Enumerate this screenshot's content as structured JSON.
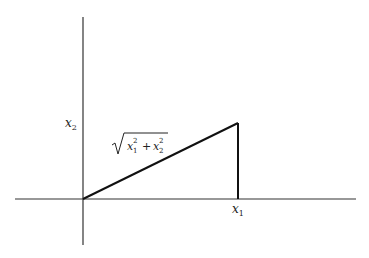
{
  "diagram": {
    "type": "right-triangle-vector-magnitude",
    "axes": {
      "horizontal": {
        "label": "x",
        "subscript": "1"
      },
      "vertical": {
        "label": "x",
        "subscript": "2"
      }
    },
    "labels": {
      "x1_var": "x",
      "x1_sub": "1",
      "x2_var": "x",
      "x2_sub": "2",
      "hypotenuse": {
        "term1_var": "x",
        "term1_sub": "1",
        "term1_sup": "2",
        "plus": "+",
        "term2_var": "x",
        "term2_sub": "2",
        "term2_sup": "2"
      }
    },
    "colors": {
      "axis": "#333333",
      "triangle": "#111111",
      "text": "#222222"
    }
  }
}
